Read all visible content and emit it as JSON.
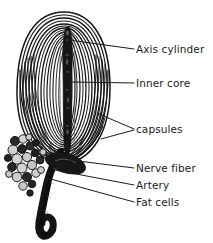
{
  "figure": {
    "background_color": "#ffffff",
    "ink_color": "#1a1a1a",
    "text_color": "#1c1c1c"
  },
  "labels": [
    {
      "id": "axis-cylinder",
      "text": "Axis cylinder",
      "x": 136,
      "y": 44
    },
    {
      "id": "inner-core",
      "text": "Inner core",
      "x": 136,
      "y": 78
    },
    {
      "id": "capsules",
      "text": "capsules",
      "x": 136,
      "y": 124
    },
    {
      "id": "nerve-fiber",
      "text": "Nerve fiber",
      "x": 136,
      "y": 163
    },
    {
      "id": "artery",
      "text": "Artery",
      "x": 136,
      "y": 180
    },
    {
      "id": "fat-cells",
      "text": "Fat cells",
      "x": 136,
      "y": 197
    }
  ],
  "leader_lines": [
    {
      "id": "leader-axis-cylinder",
      "from_x": 69,
      "from_y": 40,
      "to_x": 134,
      "to_y": 49
    },
    {
      "id": "leader-inner-core",
      "from_x": 72,
      "from_y": 82,
      "to_x": 134,
      "to_y": 83
    },
    {
      "id": "leader-capsules-upper",
      "from_x": 99,
      "from_y": 114,
      "to_x": 134,
      "to_y": 129
    },
    {
      "id": "leader-capsules-lower",
      "from_x": 101,
      "from_y": 139,
      "to_x": 134,
      "to_y": 130
    },
    {
      "id": "leader-nerve-fiber",
      "from_x": 70,
      "from_y": 160,
      "to_x": 134,
      "to_y": 168
    },
    {
      "id": "leader-artery",
      "from_x": 55,
      "from_y": 170,
      "to_x": 134,
      "to_y": 185
    },
    {
      "id": "leader-fat-cells",
      "from_x": 47,
      "from_y": 178,
      "to_x": 134,
      "to_y": 202
    }
  ],
  "structures": {
    "capsule_lamellae": {
      "id": "capsule-lamellae",
      "description": "concentric onion-like lamellae of the corpuscle capsule",
      "center_x": 64,
      "center_y": 88,
      "outer_rx": 47,
      "outer_ry": 76,
      "ring_count": 17
    },
    "axis_cylinder": {
      "id": "axis-cylinder-shape",
      "description": "dark central nerve ending running vertically",
      "top_y": 27,
      "bottom_y": 156,
      "center_x": 68,
      "width": 9
    },
    "nerve_stalk": {
      "id": "nerve-fiber-stalk",
      "description": "dark nerve fiber stalk descending below the corpuscle and hooking left",
      "top_y": 152,
      "bottom_y": 236
    },
    "fat_cells": {
      "id": "fat-cell-cluster",
      "description": "grape-like cluster of fat cells at lower left",
      "count": 24
    }
  }
}
